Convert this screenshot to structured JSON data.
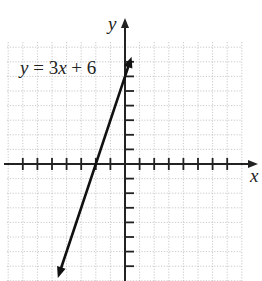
{
  "chart_data": {
    "type": "line",
    "title": "",
    "xlabel": "x",
    "ylabel": "y",
    "xlim": [
      -8,
      8
    ],
    "ylim": [
      -8,
      8
    ],
    "grid": true,
    "x_ticks": [
      -7,
      -6,
      -5,
      -4,
      -3,
      -2,
      -1,
      1,
      2,
      3,
      4,
      5,
      6,
      7
    ],
    "y_ticks": [
      -7,
      -6,
      -5,
      -4,
      -3,
      -2,
      -1,
      1,
      2,
      3,
      4,
      5,
      6,
      7
    ],
    "series": [
      {
        "name": "y = 3x + 6",
        "equation": "y = 3x + 6",
        "slope": 3,
        "intercept": 6,
        "x": [
          -4.6,
          -2,
          0,
          0.45
        ],
        "y": [
          -7.8,
          0,
          6,
          7.35
        ]
      }
    ],
    "annotations": [
      {
        "text": "y = 3x + 6",
        "position": "upper-left"
      }
    ]
  },
  "labels": {
    "x_axis": "x",
    "y_axis": "y",
    "equation_prefix": "y",
    "equation_body": " = 3",
    "equation_var": "x",
    "equation_suffix": " + 6"
  }
}
